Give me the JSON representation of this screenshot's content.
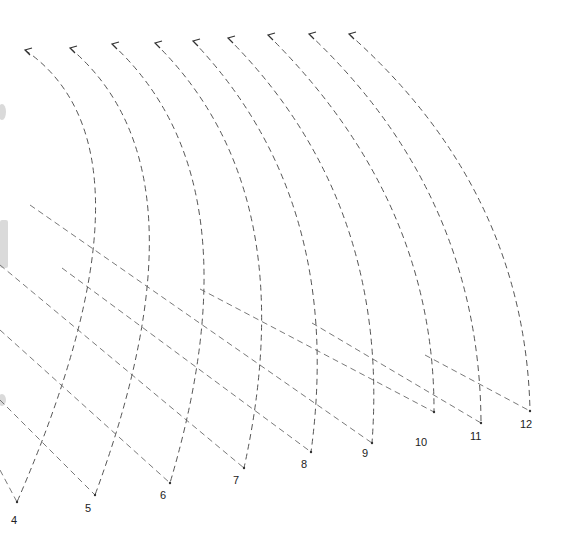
{
  "diagram": {
    "type": "dashed-arc-fan",
    "stroke_color": "#555555",
    "background": "#ffffff",
    "arcs": [
      {
        "label": "4",
        "top": [
          25,
          50
        ],
        "ctrl": [
          170,
          150
        ],
        "end": [
          17,
          502
        ],
        "label_pos": [
          11,
          524
        ]
      },
      {
        "label": "5",
        "top": [
          70,
          48
        ],
        "ctrl": [
          215,
          170
        ],
        "end": [
          95,
          495
        ],
        "label_pos": [
          85,
          512
        ]
      },
      {
        "label": "6",
        "top": [
          112,
          44
        ],
        "ctrl": [
          260,
          180
        ],
        "end": [
          170,
          483
        ],
        "label_pos": [
          160,
          499
        ]
      },
      {
        "label": "7",
        "top": [
          155,
          43
        ],
        "ctrl": [
          305,
          190
        ],
        "end": [
          244,
          468
        ],
        "label_pos": [
          233,
          484
        ]
      },
      {
        "label": "8",
        "top": [
          193,
          41
        ],
        "ctrl": [
          345,
          200
        ],
        "end": [
          311,
          452
        ],
        "label_pos": [
          301,
          468
        ]
      },
      {
        "label": "9",
        "top": [
          228,
          38
        ],
        "ctrl": [
          390,
          200
        ],
        "end": [
          372,
          443
        ],
        "label_pos": [
          362,
          457
        ]
      },
      {
        "label": "10",
        "top": [
          268,
          35
        ],
        "ctrl": [
          435,
          200
        ],
        "end": [
          434,
          412
        ],
        "label_pos": [
          415,
          446
        ]
      },
      {
        "label": "11",
        "top": [
          309,
          34
        ],
        "ctrl": [
          480,
          195
        ],
        "end": [
          481,
          423
        ],
        "label_pos": [
          470,
          440
        ]
      },
      {
        "label": "12",
        "top": [
          349,
          34
        ],
        "ctrl": [
          525,
          190
        ],
        "end": [
          530,
          411
        ],
        "label_pos": [
          520,
          428
        ]
      }
    ],
    "diagonals": [
      {
        "from": [
          30,
          205
        ],
        "to": [
          372,
          443
        ]
      },
      {
        "from": [
          62,
          268
        ],
        "to": [
          311,
          452
        ]
      },
      {
        "from": [
          200,
          289
        ],
        "to": [
          434,
          412
        ]
      },
      {
        "from": [
          312,
          323
        ],
        "to": [
          481,
          423
        ]
      },
      {
        "from": [
          425,
          355
        ],
        "to": [
          530,
          411
        ]
      },
      {
        "from": [
          0,
          265
        ],
        "to": [
          244,
          468
        ]
      },
      {
        "from": [
          0,
          330
        ],
        "to": [
          170,
          483
        ]
      },
      {
        "from": [
          0,
          400
        ],
        "to": [
          95,
          495
        ]
      },
      {
        "from": [
          0,
          470
        ],
        "to": [
          17,
          502
        ]
      }
    ]
  }
}
